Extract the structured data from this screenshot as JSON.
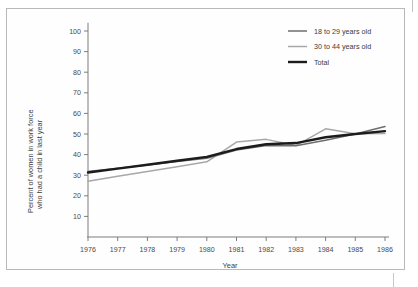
{
  "chart_data": {
    "type": "line",
    "title": "",
    "xlabel": "Year",
    "ylabel": "Percent of women in work force who had a child in last year",
    "ylabel_line1": "Percent of women in work force",
    "ylabel_line2": "who had a child in last year",
    "categories": [
      "1976",
      "1977",
      "1978",
      "1979",
      "1980",
      "1981",
      "1982",
      "1983",
      "1984",
      "1985",
      "1986"
    ],
    "x": [
      1976,
      1977,
      1978,
      1979,
      1980,
      1981,
      1982,
      1983,
      1984,
      1985,
      1986
    ],
    "xlim": [
      1976,
      1986
    ],
    "ylim": [
      0,
      104
    ],
    "yticks": [
      10,
      20,
      30,
      40,
      50,
      60,
      70,
      80,
      90,
      100
    ],
    "ytick_labels": [
      "10",
      "20",
      "30",
      "40",
      "50",
      "60",
      "70",
      "80",
      "90",
      "100"
    ],
    "grid": false,
    "legend_position": "top-right",
    "series": [
      {
        "name": "18 to 29 years old",
        "color": "#6e6e6e",
        "width": 1.5,
        "values": [
          31.8,
          33.4,
          35.0,
          36.6,
          38.2,
          42.2,
          44.4,
          44.3,
          47.0,
          50.0,
          53.6
        ]
      },
      {
        "name": "30 to 44 years old",
        "color": "#a8a8a8",
        "width": 1.5,
        "values": [
          27.1,
          29.5,
          31.8,
          34.1,
          36.5,
          46.1,
          47.4,
          44.4,
          52.5,
          50.1,
          50.3
        ]
      },
      {
        "name": "Total",
        "color": "#1c1c1c",
        "width": 2.4,
        "values": [
          31.3,
          33.2,
          35.1,
          37.0,
          38.9,
          42.7,
          45.0,
          45.6,
          48.4,
          50.0,
          51.4
        ]
      }
    ]
  },
  "legend": {
    "items": [
      {
        "label": "18 to 29 years old"
      },
      {
        "label": "30 to 44 years old"
      },
      {
        "label": "Total"
      }
    ]
  },
  "axes": {
    "x_title": "Year",
    "y_title_line1": "Percent of women in work force",
    "y_title_line2": "who had a child in last year"
  }
}
